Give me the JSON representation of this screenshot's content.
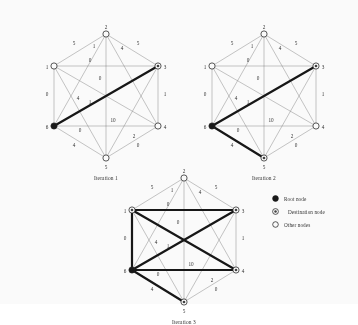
{
  "figure": {
    "node_count": 6,
    "node_labels": [
      "1",
      "2",
      "3",
      "4",
      "5",
      "6"
    ],
    "root_node": "6",
    "colors": {
      "node_stroke": "#1a1a1a",
      "root_fill": "#101010",
      "other_fill": "#ffffff",
      "normal_edge": "#7a7a7a",
      "tree_edge": "#0d0d0d",
      "label_color": "#2b2b2b"
    }
  },
  "graph": {
    "nodes": [
      {
        "id": "1",
        "label": "1",
        "x": 36,
        "y": 58,
        "label_dx": -7,
        "label_dy": 1
      },
      {
        "id": "2",
        "label": "2",
        "x": 88,
        "y": 26,
        "label_dx": 0,
        "label_dy": -7
      },
      {
        "id": "3",
        "label": "3",
        "x": 140,
        "y": 58,
        "label_dx": 7,
        "label_dy": 1
      },
      {
        "id": "4",
        "label": "4",
        "x": 140,
        "y": 118,
        "label_dx": 7,
        "label_dy": 1
      },
      {
        "id": "5",
        "label": "5",
        "x": 88,
        "y": 150,
        "label_dx": 0,
        "label_dy": 9
      },
      {
        "id": "6",
        "label": "6",
        "x": 36,
        "y": 118,
        "label_dx": -7,
        "label_dy": 1
      }
    ],
    "edges": [
      {
        "from": "1",
        "to": "2",
        "weight": "5",
        "wx": 56,
        "wy": 37
      },
      {
        "from": "2",
        "to": "3",
        "weight": "5",
        "wx": 120,
        "wy": 37
      },
      {
        "from": "3",
        "to": "4",
        "weight": "1",
        "wx": 147,
        "wy": 88
      },
      {
        "from": "4",
        "to": "5",
        "weight": "0",
        "wx": 120,
        "wy": 139
      },
      {
        "from": "5",
        "to": "6",
        "weight": "4",
        "wx": 56,
        "wy": 139
      },
      {
        "from": "6",
        "to": "1",
        "weight": "0",
        "wx": 29,
        "wy": 88
      },
      {
        "from": "1",
        "to": "3",
        "weight": "0",
        "wx": 72,
        "wy": 54
      },
      {
        "from": "6",
        "to": "4",
        "weight": "10",
        "wx": 95,
        "wy": 114
      },
      {
        "from": "2",
        "to": "5",
        "weight": "0",
        "wx": 82,
        "wy": 72
      },
      {
        "from": "2",
        "to": "6",
        "weight": "1",
        "wx": 76,
        "wy": 40
      },
      {
        "from": "2",
        "to": "4",
        "weight": "4",
        "wx": 104,
        "wy": 42
      },
      {
        "from": "1",
        "to": "5",
        "weight": "0",
        "wx": 62,
        "wy": 124
      },
      {
        "from": "1",
        "to": "4",
        "weight": "1",
        "wx": 72,
        "wy": 96
      },
      {
        "from": "3",
        "to": "6",
        "weight": "4",
        "wx": 60,
        "wy": 92
      },
      {
        "from": "3",
        "to": "5",
        "weight": "2",
        "wx": 116,
        "wy": 130
      }
    ]
  },
  "panels": [
    {
      "id": "iteration-1",
      "caption": "Iteration 1",
      "left": 18,
      "top": 8,
      "root": "6",
      "destinations": [
        "3"
      ],
      "tree_edges": [
        [
          "6",
          "3"
        ]
      ]
    },
    {
      "id": "iteration-2",
      "caption": "Iteration 2",
      "left": 176,
      "top": 8,
      "root": "6",
      "destinations": [
        "5",
        "3"
      ],
      "tree_edges": [
        [
          "6",
          "3"
        ],
        [
          "6",
          "5"
        ]
      ]
    },
    {
      "id": "iteration-3",
      "caption": "Iteration 3",
      "left": 96,
      "top": 152,
      "root": "6",
      "destinations": [
        "5",
        "3",
        "4",
        "1"
      ],
      "tree_edges": [
        [
          "6",
          "3"
        ],
        [
          "6",
          "4"
        ],
        [
          "6",
          "5"
        ],
        [
          "1",
          "4"
        ],
        [
          "1",
          "6"
        ],
        [
          "1",
          "3"
        ]
      ]
    }
  ],
  "legend": {
    "items": [
      {
        "marker": "root-node-marker",
        "label": "Root node"
      },
      {
        "marker": "destination-node-marker",
        "label": "Destination node"
      },
      {
        "marker": "other-node-marker",
        "label": "Other nodes"
      }
    ]
  }
}
